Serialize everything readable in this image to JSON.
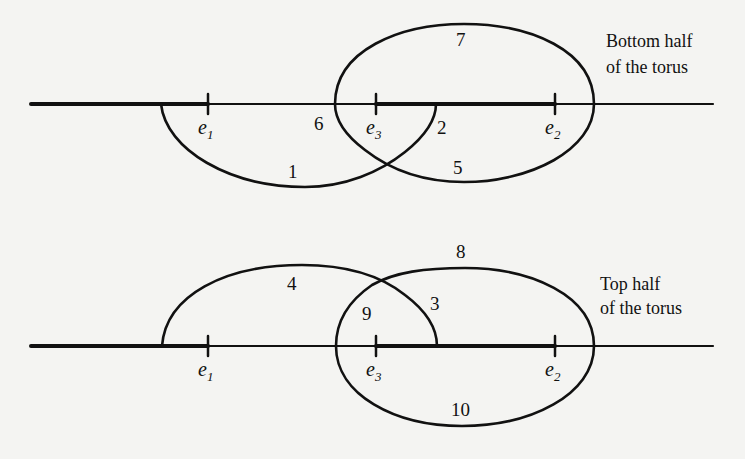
{
  "top_crop_text": "",
  "colors": {
    "ink": "#111111",
    "paper": "#f4f4f2"
  },
  "bottom_panel": {
    "caption_line1": "Bottom half",
    "caption_line2": "of the torus",
    "points": [
      {
        "name": "e",
        "sub": "1"
      },
      {
        "name": "e",
        "sub": "3"
      },
      {
        "name": "e",
        "sub": "2"
      }
    ],
    "path_labels": [
      "1",
      "2",
      "5",
      "6",
      "7"
    ]
  },
  "top_panel": {
    "caption_line1": "Top half",
    "caption_line2": "of the torus",
    "points": [
      {
        "name": "e",
        "sub": "1"
      },
      {
        "name": "e",
        "sub": "3"
      },
      {
        "name": "e",
        "sub": "2"
      }
    ],
    "path_labels": [
      "3",
      "4",
      "8",
      "9",
      "10"
    ]
  }
}
